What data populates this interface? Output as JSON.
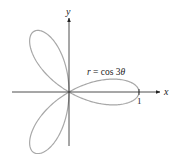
{
  "chart_data": {
    "type": "line",
    "subtype": "polar-rose",
    "equation_label": "r = cos 3θ",
    "equation_parts": {
      "r": "r",
      "eq": " = cos 3",
      "theta": "θ"
    },
    "xlabel": "x",
    "ylabel": "y",
    "tick_labels": [
      {
        "axis": "x",
        "value": 1,
        "label": "1"
      }
    ],
    "curve": {
      "function": "cos(3*theta)",
      "theta_range": [
        0,
        3.14159
      ],
      "petals": 3,
      "color": "#a8a8a8"
    },
    "axes_color": "#222222",
    "grid": false,
    "legend": null
  }
}
